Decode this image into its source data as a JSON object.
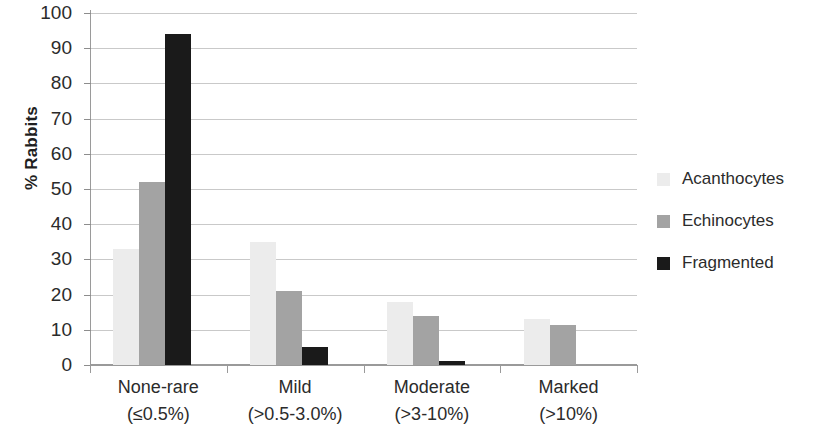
{
  "chart_data": {
    "type": "bar",
    "title": "",
    "subtitle": "",
    "xlabel": "",
    "ylabel": "% Rabbits",
    "ylim": [
      0,
      100
    ],
    "ytick_step": 10,
    "yticks": [
      0,
      10,
      20,
      30,
      40,
      50,
      60,
      70,
      80,
      90,
      100
    ],
    "grid": "horizontal",
    "legend_position": "right",
    "categories": [
      "None-rare",
      "Mild",
      "Moderate",
      "Marked"
    ],
    "category_sublabels": [
      "(≤0.5%)",
      "(>0.5-3.0%)",
      "(>3-10%)",
      "(>10%)"
    ],
    "series": [
      {
        "name": "Acanthocytes",
        "color": "#ececec",
        "values": [
          33,
          35,
          18,
          13
        ]
      },
      {
        "name": "Echinocytes",
        "color": "#a3a3a3",
        "values": [
          52,
          21,
          14,
          11.5
        ]
      },
      {
        "name": "Fragmented",
        "color": "#1a1a1a",
        "values": [
          94,
          5,
          1,
          0
        ]
      }
    ]
  }
}
